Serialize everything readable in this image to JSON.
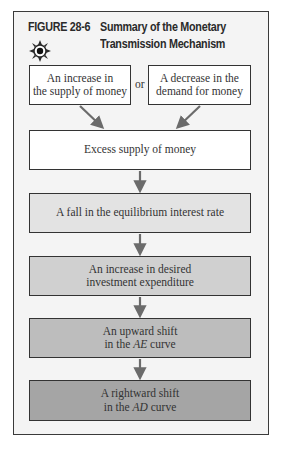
{
  "figure": {
    "label": "FIGURE 28-6",
    "title_line1": "Summary of the Monetary",
    "title_line2": "Transmission Mechanism",
    "icon": "sun-icon"
  },
  "diagram": {
    "top_left": {
      "line1": "An increase in",
      "line2": "the supply of money",
      "fill": "#ffffff"
    },
    "connector": "or",
    "top_right": {
      "line1": "A decrease in the",
      "line2": "demand for money",
      "fill": "#ffffff"
    },
    "steps": [
      {
        "line1": "Excess supply of money",
        "fill": "#ffffff"
      },
      {
        "line1": "A fall in the equilibrium interest rate",
        "fill": "#e3e3e3"
      },
      {
        "line1": "An increase in desired",
        "line2": "investment expenditure",
        "fill": "#d0d0d0"
      },
      {
        "line1": "An upward shift",
        "line2_pre": "in the ",
        "line2_italic": "AE",
        "line2_post": " curve",
        "fill": "#bdbdbd"
      },
      {
        "line1": "A rightward shift",
        "line2_pre": "in the ",
        "line2_italic": "AD",
        "line2_post": " curve",
        "fill": "#a5a5a5"
      }
    ]
  }
}
